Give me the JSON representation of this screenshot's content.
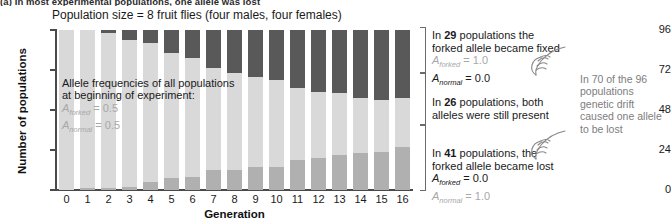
{
  "caption": "(a) In most experimental populations, one allele was lost",
  "chart": {
    "title": "Population size = 8 fruit flies (four males, four females)",
    "ylabel": "Number of populations",
    "xlabel": "Generation"
  },
  "inplot_note": {
    "line1": "Allele frequencies of all populations",
    "line2": "at beginning of experiment:",
    "allele_forked": "A",
    "allele_forked_sub": "forked",
    "allele_forked_val": "= 0.5",
    "allele_normal": "A",
    "allele_normal_sub": "normal",
    "allele_normal_val": "= 0.5"
  },
  "notes": {
    "fixed": {
      "count": "29",
      "pre": "In ",
      "post": " populations the",
      "line2": "forked allele became fixed",
      "a1_sym": "A",
      "a1_sub": "forked",
      "a1_val": "= 1.0",
      "a2_sym": "A",
      "a2_sub": "normal",
      "a2_val": "= 0.0"
    },
    "both": {
      "count": "26",
      "pre": "In ",
      "post": " populations, both",
      "line2": "alleles were still present"
    },
    "lost": {
      "count": "41",
      "pre": "In ",
      "post": " populations, the",
      "line2": "forked allele became lost",
      "a1_sym": "A",
      "a1_sub": "forked",
      "a1_val": "= 0.0",
      "a2_sym": "A",
      "a2_sub": "normal",
      "a2_val": "= 1.0"
    },
    "far": "In 70 of the 96 populations genetic drift caused one allele to be lost"
  },
  "colors": {
    "forked_lost": "#b0b0b0",
    "both_present": "#d9d9d9",
    "forked_fixed": "#595959",
    "axis": "#4a4a4a",
    "muted_text": "#a8a8a8"
  },
  "chart_data": {
    "type": "bar",
    "subtype": "stacked",
    "title": "Population size = 8 fruit flies (four males, four females)",
    "xlabel": "Generation",
    "ylabel": "Number of populations",
    "categories": [
      "0",
      "1",
      "2",
      "3",
      "4",
      "5",
      "6",
      "7",
      "8",
      "9",
      "10",
      "11",
      "12",
      "13",
      "14",
      "15",
      "16"
    ],
    "ylim": [
      0,
      96
    ],
    "yticks": [
      0,
      24,
      48,
      72,
      96
    ],
    "grid": false,
    "legend_position": "none",
    "total_populations": 96,
    "series": [
      {
        "name": "forked allele became lost",
        "color": "#b0b0b0",
        "stack_order": 0,
        "values": [
          0,
          1,
          1,
          2,
          5,
          7,
          8,
          12,
          12,
          14,
          14,
          18,
          19,
          21,
          22,
          23,
          26
        ]
      },
      {
        "name": "both alleles still present",
        "color": "#d9d9d9",
        "stack_order": 1,
        "values": [
          96,
          95,
          93,
          88,
          83,
          75,
          71,
          61,
          58,
          54,
          52,
          43,
          40,
          37,
          33,
          31,
          29
        ]
      },
      {
        "name": "forked allele became fixed",
        "color": "#595959",
        "stack_order": 2,
        "values": [
          0,
          0,
          2,
          6,
          8,
          14,
          17,
          23,
          26,
          28,
          30,
          35,
          37,
          38,
          41,
          42,
          41
        ]
      }
    ],
    "annotations": [
      "Allele frequencies of all populations at beginning of experiment: A_forked = 0.5, A_normal = 0.5",
      "In 29 populations the forked allele became fixed (A_forked = 1.0, A_normal = 0.0)",
      "In 26 populations, both alleles were still present",
      "In 41 populations, the forked allele became lost (A_forked = 0.0, A_normal = 1.0)",
      "In 70 of the 96 populations genetic drift caused one allele to be lost"
    ]
  }
}
